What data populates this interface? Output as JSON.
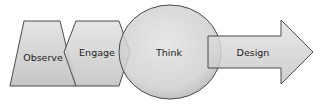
{
  "diagram": {
    "stages": [
      {
        "label": "Observe",
        "shape": "trapezoid"
      },
      {
        "label": "Engage",
        "shape": "hexagon"
      },
      {
        "label": "Think",
        "shape": "circle"
      },
      {
        "label": "Design",
        "shape": "arrow"
      }
    ],
    "colors": {
      "fill": "#d4d4d4",
      "stroke": "#4a4a4a",
      "background": "#ffffff"
    }
  }
}
